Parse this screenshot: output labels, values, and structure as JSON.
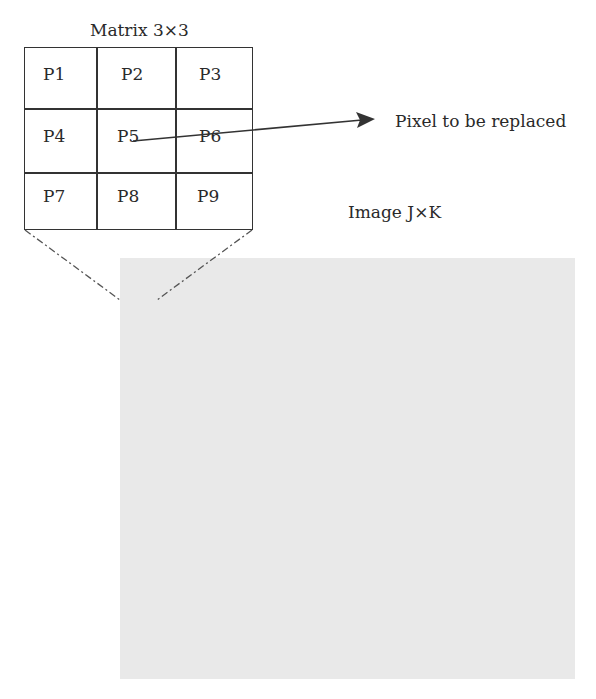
{
  "matrix": {
    "title": "Matrix 3×3",
    "cells": [
      "P1",
      "P2",
      "P3",
      "P4",
      "P5",
      "P6",
      "P7",
      "P8",
      "P9"
    ]
  },
  "annotations": {
    "pixel_label": "Pixel to be replaced",
    "image_label": "Image J×K"
  },
  "colors": {
    "image_fill": "#e9e9e9",
    "line": "#333333"
  }
}
